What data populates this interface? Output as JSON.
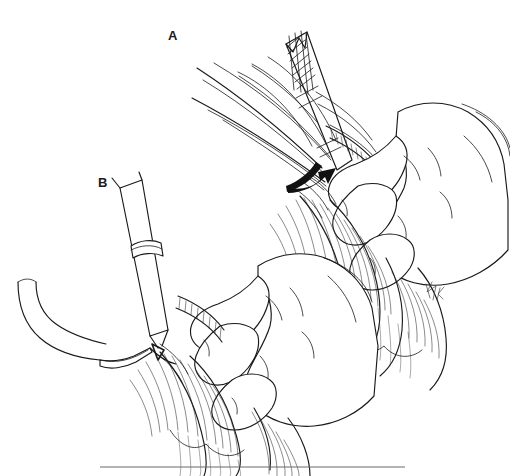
{
  "figure": {
    "kind": "line-drawing",
    "medium": "pen-and-ink medical illustration",
    "background_color": "#ffffff",
    "ink_color": "#1a1a1a",
    "width": 510,
    "height": 476,
    "caption_rule": {
      "present": true,
      "x_start": 100,
      "x_end": 405,
      "y": 467,
      "color": "#6a6a6a"
    },
    "signature": {
      "present": true,
      "text": "JK",
      "x": 428,
      "y": 292
    }
  },
  "panels": [
    {
      "id": "A",
      "label": "A",
      "label_x": 168,
      "label_y": 29,
      "description": "Gloved hand grasping hairy tissue while an instrument with cross-hatched handle and long suture strands is drawn through; a curved solid arrow indicates direction of traction.",
      "elements": {
        "instrument_label": "cross-hatched handle instrument",
        "threads_label": "suture strands",
        "arrow_label": "traction direction arrow",
        "hand_label": "grasping hand",
        "tissue_label": "haired tissue"
      }
    },
    {
      "id": "B",
      "label": "B",
      "label_x": 98,
      "label_y": 176,
      "description": "Second stage: a tapered instrument shaft with collar is directed at the incision while a curved blunt probe enters from the left; the hand continues to hold the haired tissue.",
      "elements": {
        "instrument_label": "tapered shaft instrument",
        "probe_label": "curved blunt probe",
        "hand_label": "grasping hand",
        "tissue_label": "haired tissue"
      }
    }
  ],
  "colors": {
    "ink": "#1a1a1a",
    "hair": "#2a2a2a",
    "arrow_fill": "#111111",
    "rule": "#6a6a6a",
    "paper": "#ffffff"
  }
}
